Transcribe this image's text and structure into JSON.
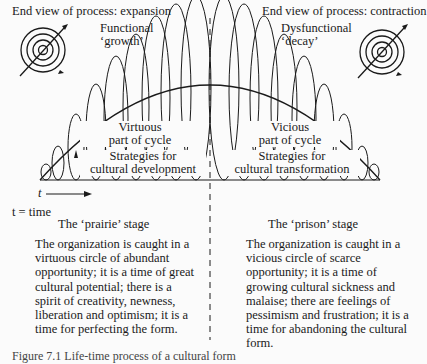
{
  "headers": {
    "left": "End view of process: expansion",
    "right": "End view of process: contraction"
  },
  "arc_labels": {
    "left_top": [
      "Functional",
      "‘growth’"
    ],
    "right_top": [
      "Dysfunctional",
      "‘decay’"
    ]
  },
  "inner_labels": {
    "left_cycle": [
      "Virtuous",
      "part of cycle"
    ],
    "left_strategy": [
      "Strategies for",
      "cultural development"
    ],
    "right_cycle": [
      "Vicious",
      "part of cycle"
    ],
    "right_strategy": [
      "Strategies for",
      "cultural transformation"
    ]
  },
  "axis": {
    "time_symbol": "t",
    "legend": "t = time"
  },
  "stages": {
    "left": {
      "title": "The ‘prairie’ stage",
      "text": "The organization is caught in a virtuous circle of abundant opportunity; it is a time of great cultural potential; there is a spirit of creativity, newness, liberation and optimism; it is a time for perfecting the form."
    },
    "right": {
      "title": "The ‘prison’ stage",
      "text": "The organization is caught in a vicious circle of scarce opportunity; it is a time of growing cultural sickness and malaise; there are feelings of pessimism and frustration; it is a time for abandoning the cultural form."
    }
  },
  "caption": "Figure 7.1  Life-time process of a cultural form"
}
